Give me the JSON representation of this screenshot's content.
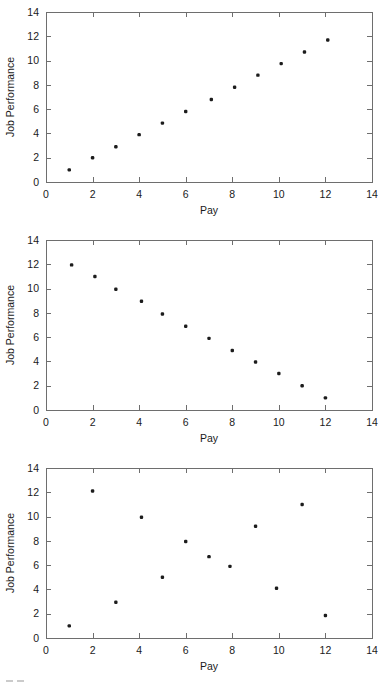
{
  "figure": {
    "background_color": "#ffffff",
    "axis_color": "#6e6e6e",
    "marker_color": "#1c1c1c",
    "text_color": "#1a1a1a"
  },
  "axis": {
    "x_title": "Pay",
    "y_title": "Job Performance",
    "x_ticks": [
      "0",
      "2",
      "4",
      "6",
      "8",
      "10",
      "12",
      "14"
    ],
    "y_ticks": [
      "0",
      "2",
      "4",
      "6",
      "8",
      "10",
      "12",
      "14"
    ]
  },
  "chart_data": [
    {
      "type": "scatter",
      "title": "",
      "xlabel": "Pay",
      "ylabel": "Job Performance",
      "xlim": [
        0,
        14
      ],
      "ylim": [
        0,
        14
      ],
      "xticks": [
        0,
        2,
        4,
        6,
        8,
        10,
        12,
        14
      ],
      "yticks": [
        0,
        2,
        4,
        6,
        8,
        10,
        12,
        14
      ],
      "grid": false,
      "legend": "none",
      "relationship": "perfect positive correlation",
      "x": [
        1.0,
        2.0,
        3.0,
        4.0,
        5.0,
        6.0,
        7.1,
        8.1,
        9.1,
        10.1,
        11.1,
        12.1
      ],
      "y": [
        1.0,
        2.0,
        2.9,
        3.9,
        4.85,
        5.8,
        6.8,
        7.8,
        8.8,
        9.75,
        10.7,
        11.7
      ]
    },
    {
      "type": "scatter",
      "title": "",
      "xlabel": "Pay",
      "ylabel": "Job Performance",
      "xlim": [
        0,
        14
      ],
      "ylim": [
        0,
        14
      ],
      "xticks": [
        0,
        2,
        4,
        6,
        8,
        10,
        12,
        14
      ],
      "yticks": [
        0,
        2,
        4,
        6,
        8,
        10,
        12,
        14
      ],
      "grid": false,
      "legend": "none",
      "relationship": "perfect negative correlation",
      "x": [
        1.1,
        2.1,
        3.0,
        4.1,
        5.0,
        6.0,
        7.0,
        8.0,
        9.0,
        10.0,
        11.0,
        12.0
      ],
      "y": [
        11.95,
        11.0,
        9.95,
        8.95,
        7.9,
        6.9,
        5.9,
        4.9,
        3.95,
        3.0,
        2.0,
        1.0
      ]
    },
    {
      "type": "scatter",
      "title": "",
      "xlabel": "Pay",
      "ylabel": "Job Performance",
      "xlim": [
        0,
        14
      ],
      "ylim": [
        0,
        14
      ],
      "xticks": [
        0,
        2,
        4,
        6,
        8,
        10,
        12,
        14
      ],
      "yticks": [
        0,
        2,
        4,
        6,
        8,
        10,
        12,
        14
      ],
      "grid": false,
      "legend": "none",
      "relationship": "no correlation",
      "x": [
        1.0,
        2.0,
        3.0,
        4.1,
        5.0,
        6.0,
        7.0,
        7.9,
        9.0,
        9.9,
        11.0,
        12.0
      ],
      "y": [
        1.0,
        12.1,
        2.95,
        9.95,
        5.0,
        7.95,
        6.7,
        5.9,
        9.2,
        4.1,
        11.0,
        1.85
      ]
    }
  ]
}
